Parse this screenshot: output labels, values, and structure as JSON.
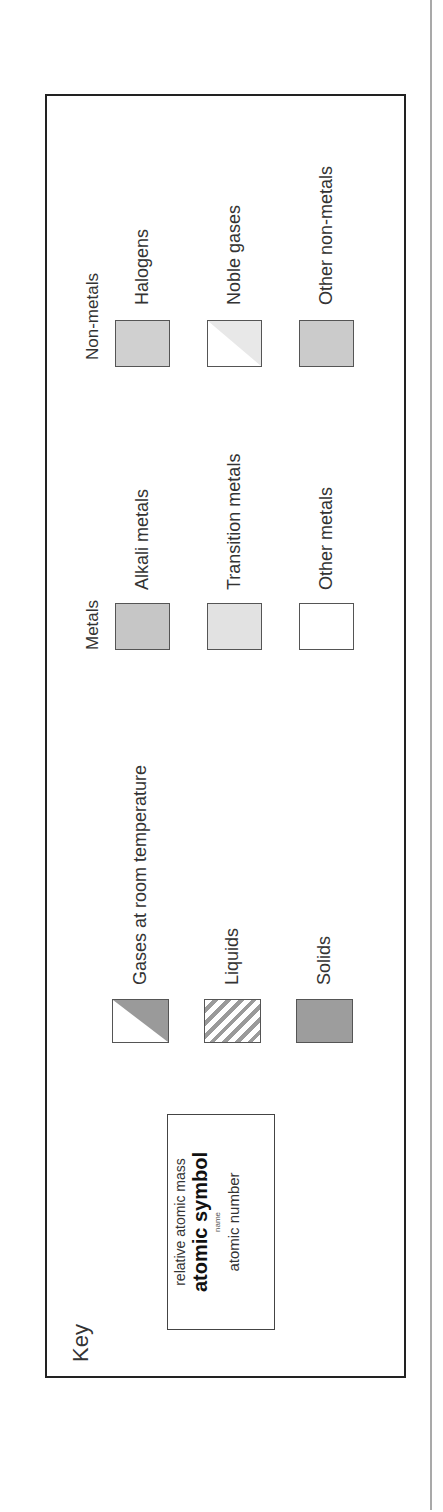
{
  "key": {
    "title": "Key",
    "element_info": {
      "line1": "relative atomic mass",
      "line2": "atomic symbol",
      "line3": "name",
      "line4": "atomic number"
    }
  },
  "states": [
    {
      "label": "Gases at room temperature",
      "swatch": "gas-half-shaded",
      "color": "#9a9a9a"
    },
    {
      "label": "Liquids",
      "swatch": "diagonal-hatch",
      "color": "#9a9a9a"
    },
    {
      "label": "Solids",
      "swatch": "solid",
      "color": "#9d9d9d"
    }
  ],
  "metals": {
    "header": "Metals",
    "items": [
      {
        "label": "Alkali metals",
        "color": "#c6c6c6"
      },
      {
        "label": "Transition metals",
        "color": "#e2e2e2"
      },
      {
        "label": "Other metals",
        "color": "#ffffff"
      }
    ]
  },
  "non_metals": {
    "header": "Non-metals",
    "items": [
      {
        "label": "Halogens",
        "color": "#d0d0d0"
      },
      {
        "label": "Noble gases",
        "color": "#e8e8e8"
      },
      {
        "label": "Other non-metals",
        "color": "#cbcbcb"
      }
    ]
  }
}
